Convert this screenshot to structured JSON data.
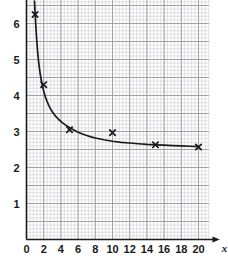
{
  "chart_data": {
    "type": "scatter",
    "title": "",
    "xlabel": "x",
    "ylabel": "y",
    "xlim": [
      0,
      21.2
    ],
    "ylim": [
      0,
      6.75
    ],
    "grid": true,
    "grid_minor_step_x": 0.4,
    "grid_minor_step_y": 0.1,
    "grid_major_step_x": 2,
    "grid_major_step_y": 0.5,
    "legend": "none",
    "x_tick_labels": [
      "0",
      "2",
      "4",
      "6",
      "8",
      "10",
      "12",
      "14",
      "16",
      "18",
      "20"
    ],
    "x_ticks": [
      0,
      2,
      4,
      6,
      8,
      10,
      12,
      14,
      16,
      18,
      20
    ],
    "y_tick_labels": [
      "1",
      "2",
      "3",
      "4",
      "5",
      "6"
    ],
    "y_ticks": [
      1,
      2,
      3,
      4,
      5,
      6
    ],
    "marker": "x",
    "x": [
      1,
      2,
      5,
      10,
      15,
      20
    ],
    "values": [
      6.25,
      4.3,
      3.05,
      2.97,
      2.63,
      2.57
    ],
    "points": [
      {
        "x": 1,
        "y": 6.25
      },
      {
        "x": 2,
        "y": 4.3
      },
      {
        "x": 5,
        "y": 3.05
      },
      {
        "x": 10,
        "y": 2.97
      },
      {
        "x": 15,
        "y": 2.63
      },
      {
        "x": 20,
        "y": 2.57
      }
    ],
    "curve": {
      "name": "fitted curve",
      "x": [
        0.93,
        1.0,
        1.1,
        1.2,
        1.3,
        1.4,
        1.5,
        1.6,
        1.8,
        2.0,
        2.2,
        2.4,
        2.6,
        2.8,
        3.0,
        3.4,
        3.8,
        4.2,
        4.6,
        5.0,
        5.5,
        6.0,
        6.5,
        7.0,
        7.5,
        8.0,
        9.0,
        10.0,
        11.0,
        12.0,
        13.0,
        14.0,
        15.0,
        16.0,
        17.0,
        18.0,
        19.0,
        20.0
      ],
      "y": [
        6.62,
        6.3,
        5.86,
        5.5,
        5.2,
        4.96,
        4.76,
        4.59,
        4.32,
        4.12,
        3.96,
        3.83,
        3.72,
        3.63,
        3.55,
        3.42,
        3.32,
        3.24,
        3.17,
        3.11,
        3.04,
        2.98,
        2.93,
        2.89,
        2.85,
        2.82,
        2.77,
        2.73,
        2.7,
        2.68,
        2.66,
        2.64,
        2.63,
        2.62,
        2.61,
        2.6,
        2.59,
        2.58
      ]
    },
    "colors": {
      "curve": "#1a1a1a",
      "marker": "#1a1a1a",
      "axis": "#1a1a1a",
      "grid_minor": "#cfcfd4",
      "grid_major": "#9a9aa0",
      "background": "#ffffff"
    }
  }
}
